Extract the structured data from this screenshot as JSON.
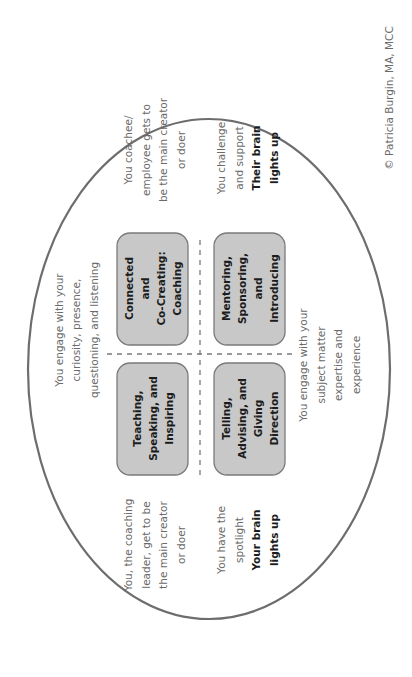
{
  "diagram": {
    "orientation": "rotated -90deg",
    "colors": {
      "ellipse_stroke": "#6d6d6d",
      "box_fill": "#c8c8c8",
      "box_stroke": "#7a7a7a",
      "divider": "#7a7a7a"
    },
    "quadrants": {
      "connected": {
        "lines": [
          "Connected",
          "and",
          "Co-Creating:",
          "Coaching"
        ]
      },
      "mentoring": {
        "lines": [
          "Mentoring,",
          "Sponsoring,",
          "and",
          "Introducing"
        ]
      },
      "teaching": {
        "lines": [
          "Teaching,",
          "Speaking, and",
          "Inspiring"
        ]
      },
      "telling": {
        "lines": [
          "Telling,",
          "Advising, and",
          "Giving",
          "Direction"
        ]
      }
    },
    "notes": {
      "engage_curiosity": {
        "lines": [
          "You engage with your",
          "curiosity, presence,",
          "questioning, and listening"
        ]
      },
      "engage_expertise": {
        "lines": [
          "You engage with your",
          "subject matter",
          "expertise and",
          "experience"
        ]
      },
      "coachee_creator": {
        "lines": [
          "You coachee/",
          "employee gets to",
          "be the main creator",
          "or doer"
        ]
      },
      "challenge_support": {
        "lines": [
          "You challenge",
          "and support"
        ],
        "bold": [
          "Their brain",
          "lights up"
        ]
      },
      "leader_creator": {
        "lines": [
          "You, the coaching",
          "leader, get to be",
          "the main creator",
          "or doer"
        ]
      },
      "spotlight": {
        "lines": [
          "You have the",
          "spotlight"
        ],
        "bold": [
          "Your brain",
          "lights up"
        ]
      }
    },
    "copyright": "© Patricia Burgin, MA, MCC"
  }
}
